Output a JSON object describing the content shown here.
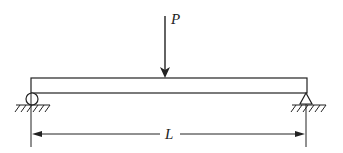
{
  "diagram": {
    "type": "simply-supported beam with point load",
    "load": {
      "label": "P",
      "direction": "down",
      "position": "midspan"
    },
    "span": {
      "label": "L"
    },
    "supports": [
      {
        "side": "left",
        "kind": "roller"
      },
      {
        "side": "right",
        "kind": "pin"
      }
    ],
    "colors": {
      "line": "#222222",
      "background": "#ffffff"
    }
  }
}
